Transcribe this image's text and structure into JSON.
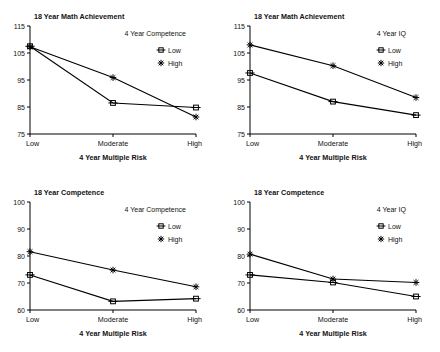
{
  "figure": {
    "title": "",
    "panel_count": 4
  },
  "chart_data": [
    {
      "id": "top-left",
      "type": "line",
      "title": "18 Year Math Achievement",
      "xlabel": "4 Year Multiple Risk",
      "ylabel": "",
      "categories": [
        "Low",
        "Moderate",
        "High"
      ],
      "ylim": [
        75,
        115
      ],
      "yticks": [
        75,
        85,
        95,
        105,
        115
      ],
      "grid": false,
      "legend_position": "upper-right",
      "legend_title": "4 Year Competence",
      "series": [
        {
          "name": "Low",
          "marker": "square-bar",
          "values": [
            107.5,
            86.5,
            84.8
          ]
        },
        {
          "name": "High",
          "marker": "star",
          "values": [
            107.3,
            95.9,
            81.3
          ]
        }
      ]
    },
    {
      "id": "top-right",
      "type": "line",
      "title": "18 Year Math Achievement",
      "xlabel": "4 Year Multiple Risk",
      "ylabel": "",
      "categories": [
        "Low",
        "Moderate",
        "High"
      ],
      "ylim": [
        75,
        115
      ],
      "yticks": [
        75,
        85,
        95,
        105,
        115
      ],
      "grid": false,
      "legend_position": "upper-right",
      "legend_title": "4 Year IQ",
      "series": [
        {
          "name": "Low",
          "marker": "square-bar",
          "values": [
            97.6,
            87.0,
            82.0
          ]
        },
        {
          "name": "High",
          "marker": "star",
          "values": [
            108.0,
            100.3,
            88.5
          ]
        }
      ]
    },
    {
      "id": "bottom-left",
      "type": "line",
      "title": "18 Year Competence",
      "xlabel": "4 Year Multiple Risk",
      "ylabel": "",
      "categories": [
        "Low",
        "Moderate",
        "High"
      ],
      "ylim": [
        60,
        100
      ],
      "yticks": [
        60,
        70,
        80,
        90,
        100
      ],
      "grid": false,
      "legend_position": "upper-right",
      "legend_title": "4 Year Competence",
      "series": [
        {
          "name": "Low",
          "marker": "square-bar",
          "values": [
            73.0,
            63.2,
            64.2
          ]
        },
        {
          "name": "High",
          "marker": "star",
          "values": [
            81.6,
            74.8,
            68.6
          ]
        }
      ]
    },
    {
      "id": "bottom-right",
      "type": "line",
      "title": "18 Year Competence",
      "xlabel": "4 Year Multiple Risk",
      "ylabel": "",
      "categories": [
        "Low",
        "Moderate",
        "High"
      ],
      "ylim": [
        60,
        100
      ],
      "yticks": [
        60,
        70,
        80,
        90,
        100
      ],
      "grid": false,
      "legend_position": "upper-right",
      "legend_title": "4 Year IQ",
      "series": [
        {
          "name": "Low",
          "marker": "square-bar",
          "values": [
            73.0,
            70.2,
            65.0
          ]
        },
        {
          "name": "High",
          "marker": "star",
          "values": [
            80.7,
            71.5,
            70.2
          ]
        }
      ]
    }
  ],
  "colors": {
    "line": "#000000",
    "text": "#111111",
    "axis": "#000000",
    "background": "#ffffff"
  }
}
